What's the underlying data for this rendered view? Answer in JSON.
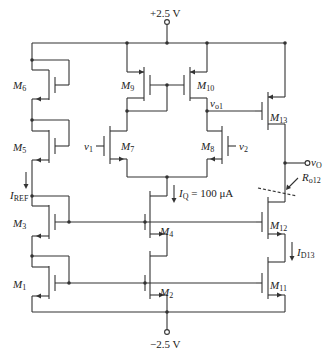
{
  "diagram": {
    "type": "circuit-schematic",
    "title": "",
    "supplies": {
      "positive": "+2.5 V",
      "negative": "−2.5 V"
    },
    "transistors": [
      {
        "id": "M1",
        "base": "M",
        "sub": "1"
      },
      {
        "id": "M2",
        "base": "M",
        "sub": "2"
      },
      {
        "id": "M3",
        "base": "M",
        "sub": "3"
      },
      {
        "id": "M4",
        "base": "M",
        "sub": "4"
      },
      {
        "id": "M5",
        "base": "M",
        "sub": "5"
      },
      {
        "id": "M6",
        "base": "M",
        "sub": "6"
      },
      {
        "id": "M7",
        "base": "M",
        "sub": "7"
      },
      {
        "id": "M8",
        "base": "M",
        "sub": "8"
      },
      {
        "id": "M9",
        "base": "M",
        "sub": "9"
      },
      {
        "id": "M10",
        "base": "M",
        "sub": "10"
      },
      {
        "id": "M11",
        "base": "M",
        "sub": "11"
      },
      {
        "id": "M12",
        "base": "M",
        "sub": "12"
      },
      {
        "id": "M13",
        "base": "M",
        "sub": "13"
      }
    ],
    "inputs": [
      {
        "id": "v1",
        "base": "v",
        "sub": "1"
      },
      {
        "id": "v2",
        "base": "v",
        "sub": "2"
      }
    ],
    "nodes": {
      "vo1": {
        "base": "v",
        "sub": "o1"
      },
      "vO": {
        "base": "v",
        "sub": "O"
      }
    },
    "currents": {
      "iref": {
        "base": "I",
        "sub": "REF"
      },
      "iq": {
        "base": "I",
        "sub": "Q",
        "value": " = 100 μA"
      },
      "id13": {
        "base": "I",
        "sub": "D13"
      }
    },
    "resistances": {
      "ro12": {
        "base": "R",
        "sub": "o12"
      }
    },
    "colors": {
      "wire": "#333333",
      "background": "#ffffff"
    }
  }
}
